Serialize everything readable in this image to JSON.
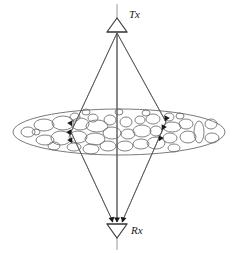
{
  "figure": {
    "background_color": "#ffffff",
    "width": 238,
    "height": 253
  },
  "colors": {
    "ray": "#555555",
    "antenna": "#3a3a3a",
    "antenna_stem": "#9a9a9a",
    "cloud_outline": "#6b6b6b",
    "scatterer_outline": "#6b6b6b",
    "arrow": "#1a1a1a",
    "label": "#1a1a1a"
  },
  "transmitter": {
    "label": "Tx",
    "label_x": 129,
    "label_y": 18,
    "apex_x": 117,
    "apex_y": 32,
    "triangle": {
      "left_x": 107,
      "right_x": 127,
      "top_y": 18,
      "bottom_y": 32
    },
    "stem": {
      "x": 117,
      "y1": 4,
      "y2": 18
    }
  },
  "receiver": {
    "label": "Rx",
    "label_x": 131,
    "label_y": 234,
    "apex_x": 117,
    "apex_y": 238,
    "triangle": {
      "left_x": 107,
      "right_x": 127,
      "top_y": 224,
      "bottom_y": 238
    },
    "stem": {
      "x": 117,
      "y1": 238,
      "y2": 250
    }
  },
  "scatter_cloud": {
    "center_x": 119,
    "center_y": 132,
    "radius_x": 106,
    "radius_y": 23
  },
  "rays": [
    {
      "name": "left-ray",
      "from_x": 117,
      "from_y": 33,
      "via_x": 71,
      "via_y": 132,
      "to_x": 113,
      "to_y": 222
    },
    {
      "name": "center-ray",
      "from_x": 117,
      "from_y": 33,
      "via_x": 117,
      "via_y": 132,
      "to_x": 117,
      "to_y": 222
    },
    {
      "name": "right-ray",
      "from_x": 117,
      "from_y": 33,
      "via_x": 166,
      "via_y": 122,
      "to_x": 122,
      "to_y": 222
    }
  ],
  "arrow_markers": [
    {
      "name": "scatter-arrow-left-upper",
      "x": 71,
      "y": 124,
      "angle": 152
    },
    {
      "name": "scatter-arrow-left-mid",
      "x": 70,
      "y": 133,
      "angle": 152
    },
    {
      "name": "scatter-arrow-left-lower",
      "x": 71,
      "y": 141,
      "angle": 152
    },
    {
      "name": "scatter-arrow-right-upper",
      "x": 166,
      "y": 119,
      "angle": 208
    },
    {
      "name": "scatter-arrow-right-mid",
      "x": 163,
      "y": 128,
      "angle": 208
    },
    {
      "name": "scatter-arrow-right-lower",
      "x": 160,
      "y": 139,
      "angle": 208
    },
    {
      "name": "rx-arrow-left",
      "x": 112,
      "y": 220,
      "angle": 168
    },
    {
      "name": "rx-arrow-center",
      "x": 117,
      "y": 220,
      "angle": 180
    },
    {
      "name": "rx-arrow-right",
      "x": 123,
      "y": 220,
      "angle": 192
    }
  ],
  "scatterers": [
    {
      "cx": 28,
      "cy": 132,
      "rx": 7,
      "ry": 5,
      "rot": 0
    },
    {
      "cx": 44,
      "cy": 125,
      "rx": 10,
      "ry": 6,
      "rot": 0
    },
    {
      "cx": 45,
      "cy": 140,
      "rx": 9,
      "ry": 5,
      "rot": 0
    },
    {
      "cx": 63,
      "cy": 123,
      "rx": 11,
      "ry": 7,
      "rot": 0
    },
    {
      "cx": 61,
      "cy": 138,
      "rx": 10,
      "ry": 7,
      "rot": 0
    },
    {
      "cx": 75,
      "cy": 117,
      "rx": 5,
      "ry": 4,
      "rot": 0
    },
    {
      "cx": 80,
      "cy": 124,
      "rx": 9,
      "ry": 6,
      "rot": 0
    },
    {
      "cx": 78,
      "cy": 137,
      "rx": 9,
      "ry": 6,
      "rot": 0
    },
    {
      "cx": 74,
      "cy": 147,
      "rx": 7,
      "ry": 4,
      "rot": 0
    },
    {
      "cx": 93,
      "cy": 118,
      "rx": 5,
      "ry": 4,
      "rot": 0
    },
    {
      "cx": 97,
      "cy": 126,
      "rx": 11,
      "ry": 6,
      "rot": 0
    },
    {
      "cx": 95,
      "cy": 139,
      "rx": 10,
      "ry": 6,
      "rot": 0
    },
    {
      "cx": 91,
      "cy": 149,
      "rx": 8,
      "ry": 5,
      "rot": 0
    },
    {
      "cx": 110,
      "cy": 120,
      "rx": 6,
      "ry": 5,
      "rot": 0
    },
    {
      "cx": 112,
      "cy": 133,
      "rx": 9,
      "ry": 6,
      "rot": 0
    },
    {
      "cx": 108,
      "cy": 146,
      "rx": 8,
      "ry": 5,
      "rot": 0
    },
    {
      "cx": 126,
      "cy": 122,
      "rx": 6,
      "ry": 5,
      "rot": 0
    },
    {
      "cx": 128,
      "cy": 134,
      "rx": 7,
      "ry": 5,
      "rot": 0
    },
    {
      "cx": 125,
      "cy": 146,
      "rx": 8,
      "ry": 5,
      "rot": 0
    },
    {
      "cx": 140,
      "cy": 120,
      "rx": 5,
      "ry": 4,
      "rot": 0
    },
    {
      "cx": 142,
      "cy": 131,
      "rx": 9,
      "ry": 6,
      "rot": 0
    },
    {
      "cx": 141,
      "cy": 144,
      "rx": 8,
      "ry": 5,
      "rot": 0
    },
    {
      "cx": 153,
      "cy": 119,
      "rx": 7,
      "ry": 5,
      "rot": 0
    },
    {
      "cx": 156,
      "cy": 131,
      "rx": 6,
      "ry": 5,
      "rot": 0
    },
    {
      "cx": 156,
      "cy": 143,
      "rx": 9,
      "ry": 6,
      "rot": 0
    },
    {
      "cx": 169,
      "cy": 117,
      "rx": 5,
      "ry": 4,
      "rot": 0
    },
    {
      "cx": 172,
      "cy": 127,
      "rx": 9,
      "ry": 5,
      "rot": 0
    },
    {
      "cx": 170,
      "cy": 138,
      "rx": 7,
      "ry": 5,
      "rot": 0
    },
    {
      "cx": 174,
      "cy": 148,
      "rx": 6,
      "ry": 4,
      "rot": 0
    },
    {
      "cx": 186,
      "cy": 124,
      "rx": 7,
      "ry": 5,
      "rot": 0
    },
    {
      "cx": 188,
      "cy": 137,
      "rx": 8,
      "ry": 6,
      "rot": 0
    },
    {
      "cx": 199,
      "cy": 132,
      "rx": 5,
      "ry": 11,
      "rot": 0
    },
    {
      "cx": 211,
      "cy": 124,
      "rx": 6,
      "ry": 5,
      "rot": 0
    },
    {
      "cx": 212,
      "cy": 138,
      "rx": 7,
      "ry": 5,
      "rot": 0
    },
    {
      "cx": 36,
      "cy": 132,
      "rx": 4,
      "ry": 3,
      "rot": 0
    },
    {
      "cx": 54,
      "cy": 146,
      "rx": 6,
      "ry": 4,
      "rot": 0
    },
    {
      "cx": 119,
      "cy": 112,
      "rx": 4,
      "ry": 3,
      "rot": 0
    },
    {
      "cx": 86,
      "cy": 112,
      "rx": 4,
      "ry": 3,
      "rot": 0
    },
    {
      "cx": 146,
      "cy": 113,
      "rx": 4,
      "ry": 3,
      "rot": 0
    },
    {
      "cx": 180,
      "cy": 116,
      "rx": 4,
      "ry": 3,
      "rot": 0
    }
  ]
}
